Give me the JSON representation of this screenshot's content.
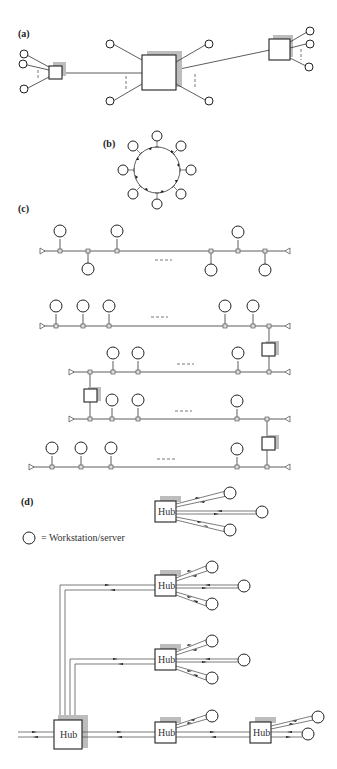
{
  "figure": {
    "panels": [
      {
        "id": "a",
        "label": "(a)",
        "topology": "star (interconnected switching nodes)"
      },
      {
        "id": "b",
        "label": "(b)",
        "topology": "ring"
      },
      {
        "id": "c",
        "label": "(c)",
        "topology": "bus (single and multiple segments with repeaters)"
      },
      {
        "id": "d",
        "label": "(d)",
        "topology": "hub / tree"
      }
    ],
    "hub_label": "Hub",
    "legend": {
      "symbol": "circle",
      "text": "= Workstation/server"
    },
    "colors": {
      "stroke": "#222222",
      "shadow": "#bdbdbd",
      "background": "#ffffff"
    }
  }
}
